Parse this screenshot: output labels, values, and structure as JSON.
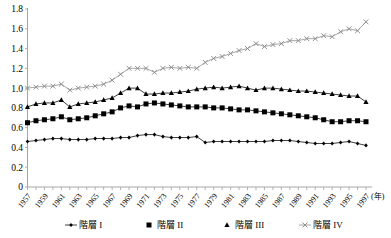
{
  "chart_data": {
    "type": "line",
    "title": "",
    "xlabel": "(年)",
    "ylabel": "",
    "ylim": [
      0,
      1.8
    ],
    "ytick_values": [
      0,
      0.2,
      0.4,
      0.6,
      0.8,
      1.0,
      1.2,
      1.4,
      1.6,
      1.8
    ],
    "ytick_labels": [
      "0",
      "0.2",
      "0.4",
      "0.6",
      "0.8",
      "1.0",
      "1.2",
      "1.4",
      "1.6",
      "1.8"
    ],
    "x": [
      1957,
      1958,
      1959,
      1960,
      1961,
      1962,
      1963,
      1964,
      1965,
      1966,
      1967,
      1968,
      1969,
      1970,
      1971,
      1972,
      1973,
      1974,
      1975,
      1976,
      1977,
      1978,
      1979,
      1980,
      1981,
      1982,
      1983,
      1984,
      1985,
      1986,
      1987,
      1988,
      1989,
      1990,
      1991,
      1992,
      1993,
      1994,
      1995,
      1996,
      1997
    ],
    "xtick_labels": [
      "1957",
      "1959",
      "1961",
      "1963",
      "1965",
      "1967",
      "1969",
      "1971",
      "1973",
      "1975",
      "1977",
      "1979",
      "1981",
      "1983",
      "1985",
      "1987",
      "1989",
      "1991",
      "1993",
      "1995",
      "1997"
    ],
    "xtick_years": [
      1957,
      1959,
      1961,
      1963,
      1965,
      1967,
      1969,
      1971,
      1973,
      1975,
      1977,
      1979,
      1981,
      1983,
      1985,
      1987,
      1989,
      1991,
      1993,
      1995,
      1997
    ],
    "grid": false,
    "legend_position": "bottom",
    "series": [
      {
        "name": "階層 I",
        "marker": "diamond",
        "color": "#000000",
        "values": [
          0.46,
          0.47,
          0.48,
          0.49,
          0.49,
          0.48,
          0.48,
          0.48,
          0.49,
          0.49,
          0.49,
          0.5,
          0.5,
          0.52,
          0.53,
          0.53,
          0.51,
          0.5,
          0.5,
          0.5,
          0.51,
          0.45,
          0.46,
          0.46,
          0.46,
          0.46,
          0.46,
          0.46,
          0.46,
          0.47,
          0.47,
          0.47,
          0.46,
          0.45,
          0.44,
          0.44,
          0.44,
          0.45,
          0.46,
          0.44,
          0.42
        ]
      },
      {
        "name": "階層 II",
        "marker": "square",
        "color": "#000000",
        "values": [
          0.65,
          0.67,
          0.68,
          0.69,
          0.71,
          0.68,
          0.69,
          0.7,
          0.72,
          0.74,
          0.76,
          0.8,
          0.82,
          0.81,
          0.84,
          0.85,
          0.84,
          0.83,
          0.82,
          0.81,
          0.81,
          0.81,
          0.8,
          0.8,
          0.79,
          0.78,
          0.78,
          0.77,
          0.76,
          0.75,
          0.74,
          0.73,
          0.72,
          0.71,
          0.7,
          0.68,
          0.66,
          0.66,
          0.67,
          0.67,
          0.66
        ]
      },
      {
        "name": "階層 III",
        "marker": "triangle",
        "color": "#000000",
        "values": [
          0.81,
          0.84,
          0.85,
          0.85,
          0.88,
          0.81,
          0.84,
          0.85,
          0.86,
          0.88,
          0.9,
          0.95,
          1.0,
          1.0,
          0.94,
          0.94,
          0.95,
          0.95,
          0.96,
          0.97,
          0.99,
          1.0,
          1.01,
          1.0,
          1.01,
          1.02,
          1.0,
          0.98,
          1.0,
          1.0,
          0.99,
          0.98,
          0.97,
          0.97,
          0.96,
          0.95,
          0.94,
          0.93,
          0.92,
          0.92,
          0.86
        ]
      },
      {
        "name": "階層 IV",
        "marker": "cross-x",
        "color": "#8a8a8a",
        "values": [
          1.0,
          1.01,
          1.02,
          1.02,
          1.04,
          0.98,
          1.0,
          1.01,
          1.02,
          1.04,
          1.08,
          1.14,
          1.2,
          1.2,
          1.2,
          1.16,
          1.2,
          1.21,
          1.2,
          1.21,
          1.2,
          1.26,
          1.3,
          1.32,
          1.35,
          1.38,
          1.4,
          1.45,
          1.42,
          1.44,
          1.45,
          1.48,
          1.48,
          1.5,
          1.5,
          1.53,
          1.52,
          1.57,
          1.6,
          1.58,
          1.67
        ]
      }
    ]
  },
  "legend": {
    "items": [
      {
        "label": "階層 I",
        "marker": "diamond"
      },
      {
        "label": "階層 II",
        "marker": "square"
      },
      {
        "label": "階層 III",
        "marker": "triangle"
      },
      {
        "label": "階層 IV",
        "marker": "cross-x"
      }
    ]
  }
}
